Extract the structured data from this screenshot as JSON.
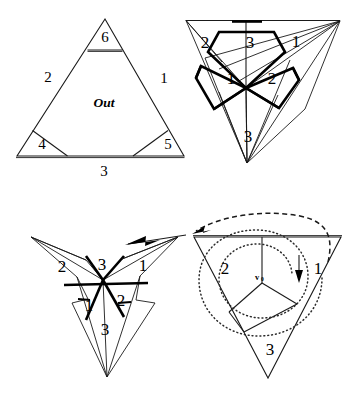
{
  "figure": {
    "background_color": "#ffffff",
    "ink_color": "#000000",
    "panels": [
      {
        "id": "panel-top-left",
        "name": "flat-triangle-with-out-region",
        "description": "Upright triangle with corner flaps cut off and region labelled Out",
        "labels": [
          {
            "text": "6",
            "x": 105,
            "y": 39
          },
          {
            "text": "2",
            "x": 48,
            "y": 79
          },
          {
            "text": "1",
            "x": 164,
            "y": 80
          },
          {
            "text": "Out",
            "x": 104,
            "y": 104,
            "style": "italic"
          },
          {
            "text": "4",
            "x": 42,
            "y": 146
          },
          {
            "text": "5",
            "x": 168,
            "y": 146
          },
          {
            "text": "3",
            "x": 104,
            "y": 173
          }
        ]
      },
      {
        "id": "panel-top-right",
        "name": "folded-cone-three-flaps",
        "description": "Downward cone formed by folding, showing bold flaps numbered 3,1,2 around the apex and outer labels 2,1,3",
        "labels": [
          {
            "text": "2",
            "x": 205,
            "y": 44
          },
          {
            "text": "3",
            "x": 250,
            "y": 44
          },
          {
            "text": "1",
            "x": 296,
            "y": 43
          },
          {
            "text": "1",
            "x": 231,
            "y": 80
          },
          {
            "text": "2",
            "x": 272,
            "y": 80
          },
          {
            "text": "3",
            "x": 248,
            "y": 138
          }
        ]
      },
      {
        "id": "panel-bottom-left",
        "name": "three-pointed-star-unfolding",
        "description": "Three pointed star shape with bold creases, flaps numbered 2,3,1 above and 1,2,3 below, with a solid arrow entering from the upper right",
        "labels": [
          {
            "text": "2",
            "x": 62,
            "y": 268
          },
          {
            "text": "3",
            "x": 102,
            "y": 266
          },
          {
            "text": "1",
            "x": 143,
            "y": 267
          },
          {
            "text": "1",
            "x": 89,
            "y": 307
          },
          {
            "text": "2",
            "x": 121,
            "y": 302
          },
          {
            "text": "3",
            "x": 105,
            "y": 329
          }
        ],
        "arrow": {
          "name": "solid-fold-arrow",
          "from_x": 186,
          "from_y": 236,
          "to_x": 126,
          "to_y": 245
        }
      },
      {
        "id": "panel-bottom-right",
        "name": "inverted-triangle-with-rotation",
        "description": "Inverted triangle split into three sectors about interior vertex v0, with a dotted spiral and a small downward arrow, plus a dashed arc arrow looping to the left panel",
        "labels": [
          {
            "text": "2",
            "x": 225,
            "y": 270
          },
          {
            "text": "1",
            "x": 318,
            "y": 270
          },
          {
            "text": "3",
            "x": 270,
            "y": 351
          }
        ],
        "vertex_label": {
          "name": "v0",
          "base": "v",
          "subscript": "0",
          "x": 258,
          "y": 277
        },
        "arrows": [
          {
            "name": "rotation-arrow-down",
            "x": 299,
            "y": 258,
            "length": 24
          },
          {
            "name": "dashed-transfer-arrow",
            "from_x": 330,
            "from_y": 255,
            "to_x": 190,
            "to_y": 235
          }
        ]
      }
    ]
  }
}
